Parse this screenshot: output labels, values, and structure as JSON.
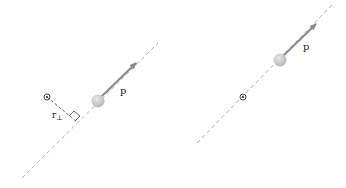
{
  "panels": [
    {
      "id": "left",
      "momentum_label": "p",
      "perp_distance_label_main": "r",
      "perp_distance_label_sub": "⊥",
      "origin_symbol": "out-of-page-dot-icon",
      "shows_perpendicular": true
    },
    {
      "id": "right",
      "momentum_label": "p",
      "origin_symbol": "out-of-page-dot-icon",
      "shows_perpendicular": false
    }
  ],
  "colors": {
    "line": "#b0b0b0",
    "arrow": "#8a8a8a",
    "ball": "#c4c4c4",
    "ball_highlight": "#e2e2e2",
    "text": "#222222"
  }
}
